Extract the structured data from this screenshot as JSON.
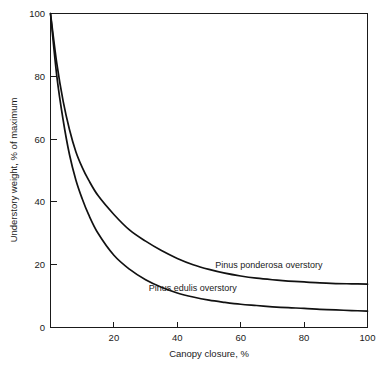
{
  "chart_data": {
    "type": "line",
    "title": "",
    "xlabel": "Canopy closure, %",
    "ylabel": "Understory weight, % of maximum",
    "xlim": [
      0,
      100
    ],
    "ylim": [
      0,
      100
    ],
    "xticks": [
      20,
      40,
      60,
      80,
      100
    ],
    "yticks": [
      0,
      20,
      40,
      60,
      80,
      100
    ],
    "xtick_labels": [
      "20",
      "40",
      "60",
      "80",
      "100"
    ],
    "ytick_labels": [
      "0",
      "20",
      "40",
      "60",
      "80",
      "100"
    ],
    "grid": false,
    "legend": "inline-curve-labels",
    "x": [
      0,
      2,
      4,
      6,
      8,
      10,
      12,
      15,
      20,
      25,
      30,
      35,
      40,
      45,
      50,
      55,
      60,
      65,
      70,
      75,
      80,
      85,
      90,
      95,
      100
    ],
    "series": [
      {
        "name": "Pinus ponderosa overstory",
        "label": "Pinus ponderosa overstory",
        "color": "#111111",
        "values": [
          100,
          84,
          72,
          63,
          56,
          51,
          47,
          42,
          36,
          31,
          27.5,
          24.5,
          22,
          20,
          18.5,
          17.3,
          16.4,
          15.7,
          15.2,
          14.8,
          14.5,
          14.2,
          14.0,
          13.9,
          13.8
        ],
        "label_x": 52,
        "label_y": 19
      },
      {
        "name": "Pinus edulis overstory",
        "label": "Pinus edulis overstory",
        "color": "#111111",
        "values": [
          100,
          80,
          66,
          55,
          47,
          41,
          36,
          30,
          23,
          18.5,
          15.2,
          12.8,
          11.0,
          9.7,
          8.7,
          8.0,
          7.4,
          7.0,
          6.6,
          6.3,
          6.1,
          5.8,
          5.6,
          5.4,
          5.2
        ],
        "label_x": 31,
        "label_y": 11.5
      }
    ],
    "annotations": [
      {
        "text": "Pinus ponderosa overstory",
        "x": 52,
        "y": 19
      },
      {
        "text": "Pinus edulis overstory",
        "x": 31,
        "y": 11.5
      }
    ]
  }
}
